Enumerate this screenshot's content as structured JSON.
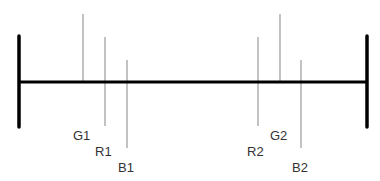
{
  "diagram": {
    "axis": {
      "x1": 19,
      "x2": 367,
      "y": 82,
      "color": "#000000"
    },
    "end_bars": [
      {
        "x": 19,
        "y1": 36,
        "y2": 127
      },
      {
        "x": 367,
        "y1": 36,
        "y2": 127
      }
    ],
    "markers": [
      {
        "label": "G1",
        "x": 83,
        "y1": 14,
        "y2": 82,
        "lx": 73,
        "ly": 131
      },
      {
        "label": "R1",
        "x": 105,
        "y1": 37,
        "y2": 126,
        "lx": 95,
        "ly": 146
      },
      {
        "label": "B1",
        "x": 127,
        "y1": 60,
        "y2": 148,
        "lx": 118,
        "ly": 163
      },
      {
        "label": "R2",
        "x": 258,
        "y1": 37,
        "y2": 126,
        "lx": 247,
        "ly": 146
      },
      {
        "label": "G2",
        "x": 280,
        "y1": 14,
        "y2": 82,
        "lx": 270,
        "ly": 131
      },
      {
        "label": "B2",
        "x": 301,
        "y1": 60,
        "y2": 148,
        "lx": 292,
        "ly": 163
      }
    ],
    "marker_color": "#999999"
  },
  "labels": {
    "g1": "G1",
    "r1": "R1",
    "b1": "B1",
    "r2": "R2",
    "g2": "G2",
    "b2": "B2"
  }
}
